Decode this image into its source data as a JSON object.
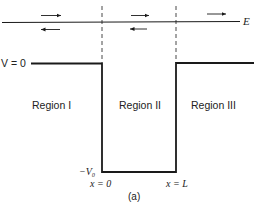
{
  "diagram": {
    "type": "finite-square-well-potential",
    "energy_label": "E",
    "v_zero_label": "V = 0",
    "v_bottom_label": "−V₀",
    "x_left_label": "x = 0",
    "x_right_label": "x = L",
    "caption": "(a)",
    "regions": [
      {
        "label": "Region I"
      },
      {
        "label": "Region II"
      },
      {
        "label": "Region III"
      }
    ],
    "waves": {
      "region_1": [
        "right",
        "left"
      ],
      "region_2": [
        "right",
        "left"
      ],
      "region_3": [
        "right"
      ]
    },
    "colors": {
      "line": "#1a1a1a",
      "text": "#222222",
      "background": "#ffffff"
    }
  }
}
